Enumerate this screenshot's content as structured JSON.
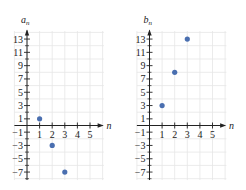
{
  "chart_data": [
    {
      "type": "scatter",
      "title": "a_n",
      "ylabel": "a_n",
      "xlabel": "n",
      "x": [
        1,
        2,
        3
      ],
      "values": [
        1,
        -3,
        -7
      ],
      "xticks": [
        1,
        2,
        3,
        4,
        5
      ],
      "yticks": [
        13,
        11,
        9,
        7,
        5,
        3,
        1,
        -1,
        -3,
        -5,
        -7
      ],
      "xlim": [
        -1,
        6
      ],
      "ylim": [
        -8,
        14
      ],
      "grid": true,
      "point_color": "#4a6fb0"
    },
    {
      "type": "scatter",
      "title": "b_n",
      "ylabel": "b_n",
      "xlabel": "n",
      "x": [
        1,
        2,
        3
      ],
      "values": [
        3,
        8,
        13
      ],
      "xticks": [
        1,
        2,
        3,
        4,
        5
      ],
      "yticks": [
        13,
        11,
        9,
        7,
        5,
        3,
        1,
        -1,
        -3,
        -5,
        -7
      ],
      "xlim": [
        -1,
        6
      ],
      "ylim": [
        -8,
        14
      ],
      "grid": true,
      "point_color": "#4a6fb0"
    }
  ],
  "labels": {
    "left_y": "a",
    "left_y_sub": "n",
    "right_y": "b",
    "right_y_sub": "n",
    "x_axis": "n"
  }
}
